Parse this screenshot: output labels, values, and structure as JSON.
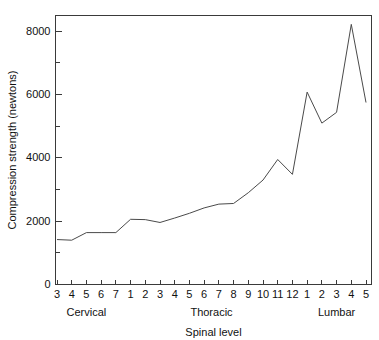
{
  "chart_data": {
    "type": "line",
    "title": "",
    "xlabel": "Spinal level",
    "ylabel": "Compression strength (newtons)",
    "categories": [
      "3",
      "4",
      "5",
      "6",
      "7",
      "1",
      "2",
      "3",
      "4",
      "5",
      "6",
      "7",
      "8",
      "9",
      "10",
      "11",
      "12",
      "1",
      "2",
      "3",
      "4",
      "5"
    ],
    "values": [
      1420,
      1400,
      1640,
      1640,
      1640,
      2060,
      2050,
      1960,
      2100,
      2250,
      2420,
      2540,
      2560,
      2900,
      3300,
      3950,
      3480,
      6080,
      5100,
      5440,
      8220,
      5750
    ],
    "series": [
      {
        "name": "Compression strength",
        "points": [
          {
            "level": "C3",
            "group": "Cervical",
            "value": 1420
          },
          {
            "level": "C4",
            "group": "Cervical",
            "value": 1400
          },
          {
            "level": "C5",
            "group": "Cervical",
            "value": 1640
          },
          {
            "level": "C6",
            "group": "Cervical",
            "value": 1640
          },
          {
            "level": "C7",
            "group": "Cervical",
            "value": 1640
          },
          {
            "level": "T1",
            "group": "Thoracic",
            "value": 2060
          },
          {
            "level": "T2",
            "group": "Thoracic",
            "value": 2050
          },
          {
            "level": "T3",
            "group": "Thoracic",
            "value": 1960
          },
          {
            "level": "T4",
            "group": "Thoracic",
            "value": 2100
          },
          {
            "level": "T5",
            "group": "Thoracic",
            "value": 2250
          },
          {
            "level": "T6",
            "group": "Thoracic",
            "value": 2420
          },
          {
            "level": "T7",
            "group": "Thoracic",
            "value": 2540
          },
          {
            "level": "T8",
            "group": "Thoracic",
            "value": 2560
          },
          {
            "level": "T9",
            "group": "Thoracic",
            "value": 2900
          },
          {
            "level": "T10",
            "group": "Thoracic",
            "value": 3300
          },
          {
            "level": "T11",
            "group": "Thoracic",
            "value": 3950
          },
          {
            "level": "T12",
            "group": "Thoracic",
            "value": 3480
          },
          {
            "level": "L1",
            "group": "Lumbar",
            "value": 6080
          },
          {
            "level": "L2",
            "group": "Lumbar",
            "value": 5100
          },
          {
            "level": "L3",
            "group": "Lumbar",
            "value": 5440
          },
          {
            "level": "L4",
            "group": "Lumbar",
            "value": 8220
          },
          {
            "level": "L5",
            "group": "Lumbar",
            "value": 5750
          }
        ]
      }
    ],
    "ylim": [
      0,
      8500
    ],
    "xlim": [
      0,
      21
    ],
    "ymajor_ticks": [
      0,
      2000,
      4000,
      6000,
      8000
    ],
    "yminor_ticks": [
      1000,
      3000,
      5000,
      7000
    ],
    "ytick_labels": [
      "0",
      "2000",
      "4000",
      "6000",
      "8000"
    ],
    "grid": false,
    "legend": null,
    "group_labels": [
      {
        "text": "Cervical",
        "center_index": 2
      },
      {
        "text": "Thoracic",
        "center_index": 10.5
      },
      {
        "text": "Lumbar",
        "center_index": 19
      }
    ],
    "colors": {
      "line": "#4a4a4a",
      "axis": "#3a3a3a",
      "text": "#111111",
      "background": "#ffffff"
    }
  }
}
